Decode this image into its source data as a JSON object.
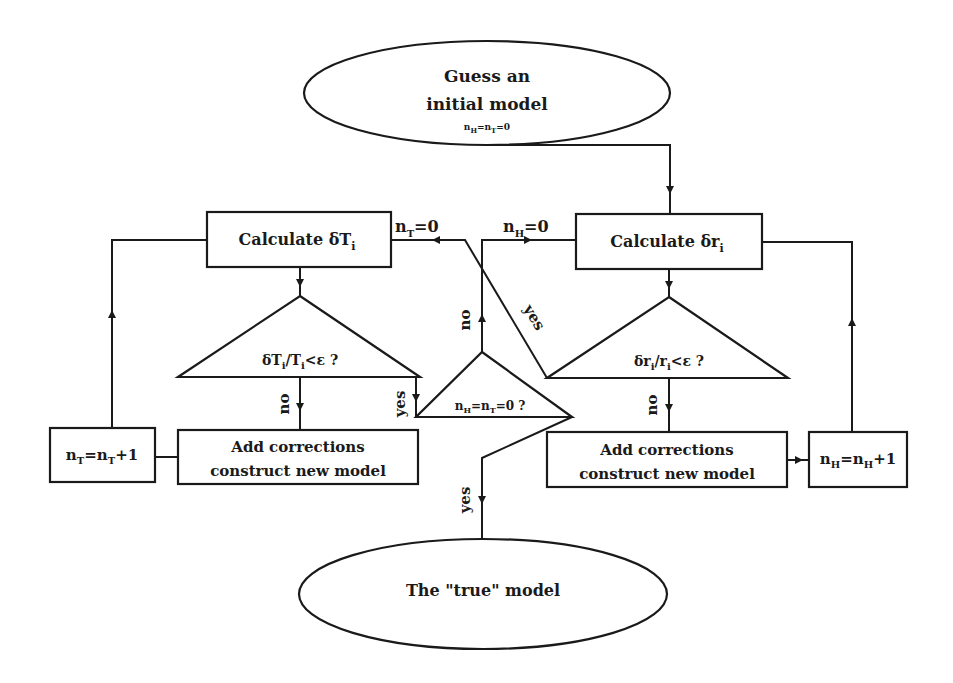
{
  "diagram": {
    "type": "flowchart",
    "colors": {
      "ink": "#1a1a1a",
      "background": "#ffffff"
    },
    "nodes": {
      "start": {
        "shape": "ellipse",
        "line1": "Guess an",
        "line2": "initial model",
        "init_n": "n",
        "init_sub1": "H",
        "init_eq1": "=n",
        "init_sub2": "T",
        "init_eq2": "=0"
      },
      "calc_T": {
        "shape": "rect",
        "label": "Calculate δT",
        "sub": "i"
      },
      "calc_r": {
        "shape": "rect",
        "label": "Calculate δr",
        "sub": "i"
      },
      "test_T": {
        "shape": "triangle",
        "a": "δT",
        "a_sub": "i",
        "b": "/T",
        "b_sub": "i",
        "c": "<ε ?"
      },
      "test_r": {
        "shape": "triangle",
        "a": "δr",
        "a_sub": "i",
        "b": "/r",
        "b_sub": "i",
        "c": "<ε ?"
      },
      "test_both": {
        "shape": "triangle",
        "a": "n",
        "a_sub": "H",
        "b": "=n",
        "b_sub": "T",
        "c": "=0 ?"
      },
      "correct_T": {
        "shape": "rect",
        "line1": "Add corrections",
        "line2": "construct new model"
      },
      "correct_r": {
        "shape": "rect",
        "line1": "Add corrections",
        "line2": "construct new model"
      },
      "inc_T": {
        "shape": "rect",
        "a": "n",
        "a_sub": "T",
        "b": "=n",
        "b_sub": "T",
        "c": "+1"
      },
      "inc_H": {
        "shape": "rect",
        "a": "n",
        "a_sub": "H",
        "b": "=n",
        "b_sub": "H",
        "c": "+1"
      },
      "end": {
        "shape": "ellipse",
        "label": "The \"true\" model"
      }
    },
    "edge_labels": {
      "reset_T": {
        "a": "n",
        "sub": "T",
        "b": "=0"
      },
      "reset_H": {
        "a": "n",
        "sub": "H",
        "b": "=0"
      },
      "no_T": "no",
      "yes_T": "yes",
      "no_r": "no",
      "no_center": "no",
      "yes_center_diag": "yes",
      "yes_end": "yes"
    }
  }
}
